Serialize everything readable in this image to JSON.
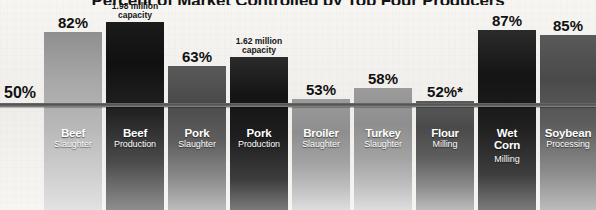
{
  "chart": {
    "title": "Percent of Market Controlled by Top Four Producers",
    "reference": {
      "label": "50%",
      "value": 50
    },
    "footnote_marker": "*"
  },
  "chart_data": {
    "type": "bar",
    "title": "Percent of Market Controlled by Top Four Producers",
    "xlabel": "",
    "ylabel": "Percent of market controlled by top four firms",
    "ylim": [
      0,
      100
    ],
    "grid": false,
    "legend": "none",
    "reference_line": 50,
    "reference_line_label": "50%",
    "categories": [
      "Beef Slaughter",
      "Beef Production",
      "Pork Slaughter",
      "Pork Production",
      "Broiler Slaughter",
      "Turkey Slaughter",
      "Flour Milling",
      "Wet Corn Milling",
      "Soybean Processing"
    ],
    "values": [
      82,
      92,
      63,
      78,
      53,
      58,
      52,
      87,
      85
    ],
    "value_labels": [
      "82%",
      "1.98 million capacity",
      "63%",
      "1.62 million capacity",
      "53%",
      "58%",
      "52%*",
      "87%",
      "85%"
    ]
  },
  "bars": [
    {
      "name": "Beef",
      "sub": "Slaughter",
      "sub2": "",
      "label": "82%",
      "label_lines": [
        "82%"
      ],
      "label_small": false,
      "shade": "light",
      "left": 44,
      "width": 58,
      "top": 32
    },
    {
      "name": "Beef",
      "sub": "Production",
      "sub2": "",
      "label": "1.98 million capacity",
      "label_lines": [
        "1.98 million",
        "capacity"
      ],
      "label_small": true,
      "shade": "dark",
      "left": 106,
      "width": 58,
      "top": 22
    },
    {
      "name": "Pork",
      "sub": "Slaughter",
      "sub2": "",
      "label": "63%",
      "label_lines": [
        "63%"
      ],
      "label_small": false,
      "shade": "mid",
      "left": 168,
      "width": 58,
      "top": 66
    },
    {
      "name": "Pork",
      "sub": "Production",
      "sub2": "",
      "label": "1.62 million capacity",
      "label_lines": [
        "1.62 million",
        "capacity"
      ],
      "label_small": true,
      "shade": "verydark",
      "left": 230,
      "width": 58,
      "top": 57
    },
    {
      "name": "Broiler",
      "sub": "Slaughter",
      "sub2": "",
      "label": "53%",
      "label_lines": [
        "53%"
      ],
      "label_small": false,
      "shade": "palemid",
      "left": 292,
      "width": 58,
      "top": 99
    },
    {
      "name": "Turkey",
      "sub": "Slaughter",
      "sub2": "",
      "label": "58%",
      "label_lines": [
        "58%"
      ],
      "label_small": false,
      "shade": "palemid",
      "left": 354,
      "width": 58,
      "top": 88
    },
    {
      "name": "Flour",
      "sub": "Milling",
      "sub2": "",
      "label": "52%*",
      "label_lines": [
        "52%*"
      ],
      "label_small": false,
      "shade": "mid",
      "left": 416,
      "width": 58,
      "top": 101
    },
    {
      "name": "Wet",
      "sub": "Milling",
      "sub2": "Corn",
      "label": "87%",
      "label_lines": [
        "87%"
      ],
      "label_small": false,
      "shade": "verydark",
      "left": 478,
      "width": 58,
      "top": 30
    },
    {
      "name": "Soybean",
      "sub": "Processing",
      "sub2": "",
      "label": "85%",
      "label_lines": [
        "85%"
      ],
      "label_small": false,
      "shade": "mid",
      "left": 540,
      "width": 56,
      "top": 35
    }
  ]
}
